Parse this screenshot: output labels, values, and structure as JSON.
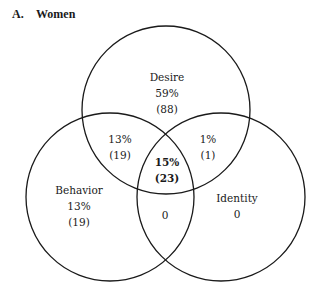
{
  "figure": {
    "panel_letter": "A.",
    "panel_title": "Women"
  },
  "circles": [
    {
      "name": "Desire",
      "cx": 166,
      "cy": 110,
      "r": 84
    },
    {
      "name": "Behavior",
      "cx": 110,
      "cy": 197,
      "r": 84
    },
    {
      "name": "Identity",
      "cx": 221,
      "cy": 197,
      "r": 84
    }
  ],
  "regions": {
    "desire_only": {
      "label": "Desire",
      "percent": "59%",
      "count": "(88)"
    },
    "desire_behavior": {
      "percent": "13%",
      "count": "(19)"
    },
    "desire_identity": {
      "percent": "1%",
      "count": "(1)"
    },
    "all_three": {
      "percent": "15%",
      "count": "(23)"
    },
    "behavior_only": {
      "label": "Behavior",
      "percent": "13%",
      "count": "(19)"
    },
    "behavior_identity": {
      "value": "0"
    },
    "identity_only": {
      "label": "Identity",
      "value": "0"
    }
  },
  "colors": {
    "stroke": "#1a1a1a",
    "background": "#ffffff"
  }
}
